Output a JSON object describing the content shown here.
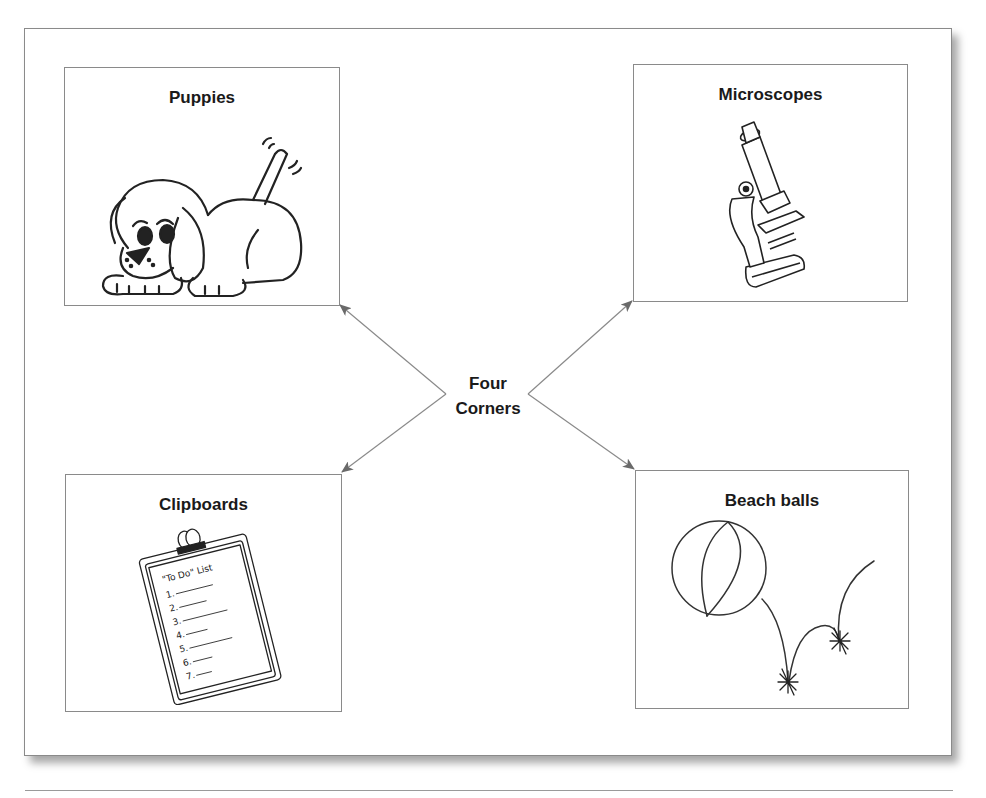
{
  "diagram": {
    "center": {
      "line1": "Four",
      "line2": "Corners"
    },
    "corners": [
      {
        "id": "top-left",
        "label": "Puppies",
        "illustration": "puppy"
      },
      {
        "id": "top-right",
        "label": "Microscopes",
        "illustration": "microscope"
      },
      {
        "id": "bottom-left",
        "label": "Clipboards",
        "illustration": "clipboard"
      },
      {
        "id": "bottom-right",
        "label": "Beach balls",
        "illustration": "beach-ball"
      }
    ],
    "clipboard_text": {
      "heading": "\"To Do\" List",
      "items": [
        "1.",
        "2.",
        "3.",
        "4.",
        "5.",
        "6.",
        "7."
      ]
    },
    "colors": {
      "line": "#8a8a8a",
      "text": "#1a1a1a",
      "ink": "#222222"
    }
  }
}
